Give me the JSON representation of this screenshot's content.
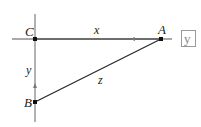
{
  "diagram": {
    "type": "right-triangle-related-rates",
    "points": [
      {
        "id": "C",
        "label": "C",
        "x": 35,
        "y": 39
      },
      {
        "id": "A",
        "label": "A",
        "x": 161,
        "y": 39
      },
      {
        "id": "B",
        "label": "B",
        "x": 35,
        "y": 102
      }
    ],
    "segments": [
      {
        "from": "C",
        "to": "A",
        "label": "x",
        "arrow": "toward C"
      },
      {
        "from": "C",
        "to": "B",
        "label": "y",
        "arrow": "toward C"
      },
      {
        "from": "A",
        "to": "B",
        "label": "z"
      }
    ],
    "labels": {
      "C": "C",
      "A": "A",
      "B": "B",
      "x": "x",
      "y": "y",
      "z": "z"
    },
    "boxed_label": "y",
    "colors": {
      "line": "#333333",
      "axis": "#555555",
      "box": "#999999"
    }
  }
}
